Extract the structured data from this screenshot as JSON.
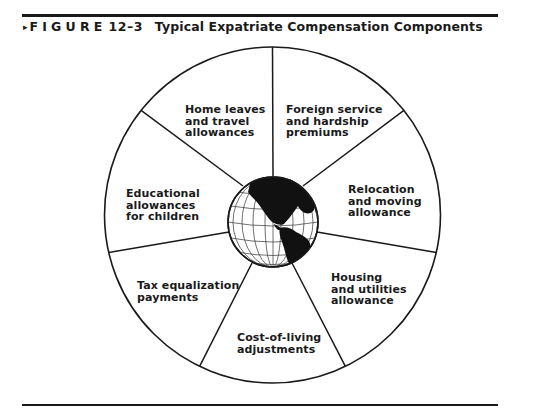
{
  "figure": {
    "marker": "▸",
    "label": "FIGURE",
    "number": "12–3",
    "title": "Typical Expatriate Compensation Components"
  },
  "diagram": {
    "type": "wheel",
    "center": "globe",
    "segments": [
      {
        "label": "Home leaves\nand travel\nallowances"
      },
      {
        "label": "Foreign service\nand hardship\npremiums"
      },
      {
        "label": "Relocation\nand moving\nallowance"
      },
      {
        "label": "Housing\nand utilities\nallowance"
      },
      {
        "label": "Cost-of-living\nadjustments"
      },
      {
        "label": "Tax equalization\npayments"
      },
      {
        "label": "Educational\nallowances\nfor children"
      }
    ]
  },
  "colors": {
    "ink": "#1a1a1a",
    "background": "#ffffff"
  }
}
